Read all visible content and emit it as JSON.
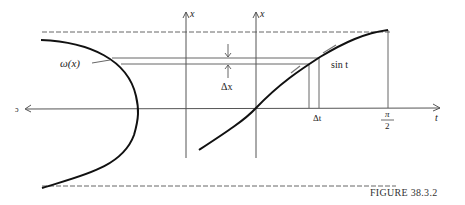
{
  "figure": {
    "caption": "FIGURE 38.3.2",
    "labels": {
      "left_axis_x": "x",
      "right_axis_x": "x",
      "omega": "ω(x)",
      "delta_x": "Δx",
      "sin_t": "sin t",
      "delta_t": "Δt",
      "pi": "π",
      "two": "2",
      "t_axis": "t",
      "left_arrow_label": "ɔ"
    },
    "colors": {
      "curve": "#111111",
      "lines": "#555555",
      "dashed": "#666666"
    }
  }
}
